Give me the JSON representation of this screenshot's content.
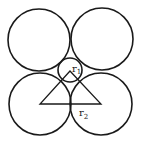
{
  "diagram": {
    "title": "",
    "stroke_color": "#1a1a1a",
    "background": "#ffffff",
    "large_circles": [
      {
        "name": "top-left",
        "cx": 39,
        "cy": 40,
        "r": 31
      },
      {
        "name": "top-right",
        "cx": 102,
        "cy": 39,
        "r": 31
      },
      {
        "name": "bottom-left",
        "cx": 40,
        "cy": 104,
        "r": 31
      },
      {
        "name": "bottom-right",
        "cx": 101,
        "cy": 104,
        "r": 31
      }
    ],
    "small_circle": {
      "cx": 70,
      "cy": 70,
      "r": 12
    },
    "triangle": {
      "apex": [
        70,
        71
      ],
      "left": [
        40,
        104
      ],
      "right": [
        101,
        104
      ]
    },
    "labels": {
      "r1": {
        "base": "r",
        "sub": "1"
      },
      "r2": {
        "base": "r",
        "sub": "2"
      }
    }
  }
}
